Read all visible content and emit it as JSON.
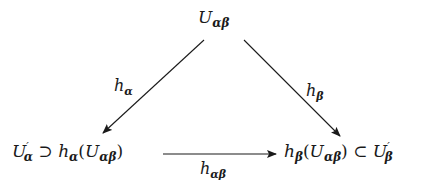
{
  "diagram": {
    "type": "commutative-diagram",
    "nodes": {
      "top": {
        "base": "U",
        "sub": "αβ"
      },
      "left": {
        "space": {
          "base": "U",
          "prime": "′",
          "sub": "α"
        },
        "relation": "⊃",
        "map": {
          "base": "h",
          "sub": "α"
        },
        "arg_open": "(",
        "arg": {
          "base": "U",
          "sub": "αβ"
        },
        "arg_close": ")"
      },
      "right": {
        "map": {
          "base": "h",
          "sub": "β"
        },
        "arg_open": "(",
        "arg": {
          "base": "U",
          "sub": "αβ"
        },
        "arg_close": ")",
        "relation": "⊂",
        "space": {
          "base": "U",
          "prime": "′",
          "sub": "β"
        }
      }
    },
    "edges": [
      {
        "from": "top",
        "to": "left",
        "label": {
          "base": "h",
          "sub": "α"
        }
      },
      {
        "from": "top",
        "to": "right",
        "label": {
          "base": "h",
          "sub": "β"
        }
      },
      {
        "from": "left",
        "to": "right",
        "label": {
          "base": "h",
          "sub": "αβ"
        }
      }
    ],
    "colors": {
      "ink": "#1a1a1a",
      "background": "#ffffff"
    }
  }
}
